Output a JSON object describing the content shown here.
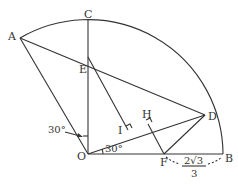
{
  "diagram": {
    "type": "geometry",
    "colors": {
      "stroke": "#333333",
      "background": "#ffffff"
    },
    "points": {
      "A": "A",
      "B": "B",
      "C": "C",
      "D": "D",
      "E": "E",
      "F": "F",
      "H": "H",
      "I": "I",
      "O": "O"
    },
    "angles": {
      "angle_AOC": "30°",
      "angle_DOB": "30°"
    },
    "dimensions": {
      "FB_numerator": "2√3",
      "FB_denominator": "3"
    }
  }
}
